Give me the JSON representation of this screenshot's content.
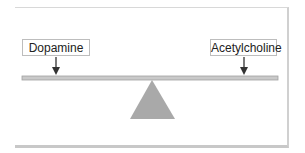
{
  "diagram": {
    "left_label": "Dopamine",
    "right_label": "Acetylcholine",
    "fulcrum": "triangle",
    "beam": "balance-beam",
    "colors": {
      "beam": "#c4c4c4",
      "fulcrum": "#a8a8a8",
      "arrow": "#333333",
      "border": "#cccccc"
    }
  }
}
